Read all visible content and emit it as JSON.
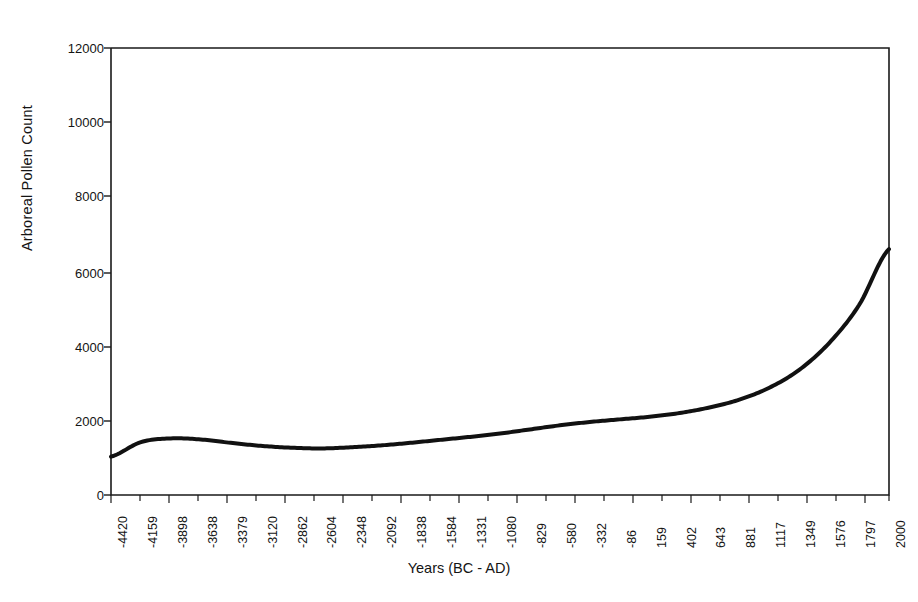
{
  "chart_data": {
    "type": "line",
    "title": "",
    "xlabel": "Years (BC - AD)",
    "ylabel": "Arboreal Pollen Count",
    "ylim": [
      0,
      12000
    ],
    "ytick_labels": [
      "12000",
      "10000",
      "8000",
      "6000",
      "4000",
      "2000",
      "0"
    ],
    "ytick_values": [
      12000,
      10000,
      8000,
      6000,
      4000,
      2000,
      0
    ],
    "grid": false,
    "legend": null,
    "line_color": "#111111",
    "line_width_px": 4,
    "categories": [
      "-4420",
      "-4159",
      "-3898",
      "-3638",
      "-3379",
      "-3120",
      "-2862",
      "-2604",
      "-2348",
      "-2092",
      "-1838",
      "-1584",
      "-1331",
      "-1080",
      "-829",
      "-580",
      "-332",
      "-86",
      "159",
      "402",
      "643",
      "881",
      "1117",
      "1349",
      "1576",
      "1797",
      "2000"
    ],
    "x": [
      -4420,
      -4159,
      -3898,
      -3638,
      -3379,
      -3120,
      -2862,
      -2604,
      -2348,
      -2092,
      -1838,
      -1584,
      -1331,
      -1080,
      -829,
      -580,
      -332,
      -86,
      159,
      402,
      643,
      881,
      1117,
      1349,
      1576,
      1797,
      2000
    ],
    "values": [
      1030,
      1420,
      1520,
      1490,
      1400,
      1320,
      1270,
      1250,
      1280,
      1330,
      1400,
      1480,
      1560,
      1650,
      1760,
      1870,
      1960,
      2030,
      2100,
      2200,
      2350,
      2560,
      2880,
      3360,
      4080,
      5100,
      6600
    ],
    "series": [
      {
        "name": "Arboreal Pollen Count",
        "values": [
          1030,
          1420,
          1520,
          1490,
          1400,
          1320,
          1270,
          1250,
          1280,
          1330,
          1400,
          1480,
          1560,
          1650,
          1760,
          1870,
          1960,
          2030,
          2100,
          2200,
          2350,
          2560,
          2880,
          3360,
          4080,
          5100,
          6600
        ]
      }
    ]
  }
}
